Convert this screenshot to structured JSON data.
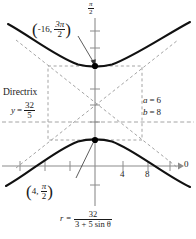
{
  "figure": {
    "type": "polar-conic-graph",
    "conic": "hyperbola",
    "equation": {
      "lhs": "r",
      "eq": "=",
      "numerator": "32",
      "denominator": "3 + 5 sin θ"
    },
    "axes": {
      "vertical_top_label": {
        "num": "π",
        "den": "2"
      },
      "polar_axis_label": "0",
      "x_tick_labels": [
        "4",
        "8"
      ],
      "x_tick_values": [
        4,
        8
      ]
    },
    "points": [
      {
        "name": "upper-vertex",
        "r": "-16",
        "theta_num": "3π",
        "theta_den": "2",
        "label": "(-16, 3π/2)"
      },
      {
        "name": "lower-vertex",
        "r": "4",
        "theta_num": "π",
        "theta_den": "2",
        "label": "(4, π/2)"
      }
    ],
    "directrix": {
      "word": "Directrix",
      "lhs": "y",
      "eq": "=",
      "num": "32",
      "den": "5"
    },
    "parameters": [
      {
        "symbol": "a",
        "eq": "=",
        "value": "6"
      },
      {
        "symbol": "b",
        "eq": "=",
        "value": "8"
      }
    ],
    "colors": {
      "curve": "#111111",
      "axis": "#8c8c8c",
      "dashed": "#9a9a9a",
      "text": "#1a1a1a",
      "point": "#000000"
    }
  }
}
